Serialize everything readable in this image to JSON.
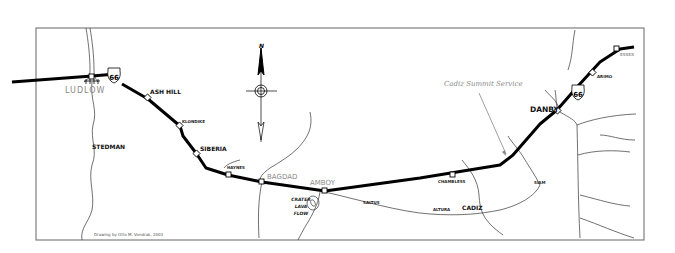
{
  "map": {
    "title": "Route 66 — Ludlow to Danby",
    "colors": {
      "route": "#000000",
      "roads": "#333333",
      "frame": "#555555",
      "gray_label": "#8a8a8a",
      "background": "#ffffff"
    },
    "compass": {
      "label": "N"
    },
    "shields": [
      {
        "name": "us-66-shield-ludlow",
        "number": "66"
      },
      {
        "name": "us-66-shield-danby",
        "number": "66"
      }
    ],
    "towns": {
      "ludlow": "LUDLOW",
      "ash_hill": "ASH HILL",
      "klondike": "KLONDIKE",
      "siberia": "SIBERIA",
      "haynes": "HAYNES",
      "bagdad": "BAGDAD",
      "amboy": "AMBOY",
      "chambless": "CHAMBLESS",
      "danby": "DANBY",
      "arimo": "ARIMO",
      "essex": "ESSEX",
      "stedman": "STEDMAN",
      "saltus": "SALTUS",
      "altura": "ALTURA",
      "cadiz": "CADIZ",
      "siam": "SIAM"
    },
    "features": {
      "crater_line1": "CRATER",
      "crater_line2": "LAVA",
      "crater_line3": "FLOW",
      "service_label": "Cadiz Summit Service"
    },
    "credit": "Drawing by Otto M. Vondrak, 2003"
  }
}
